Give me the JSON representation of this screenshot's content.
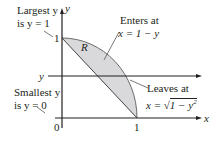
{
  "diagram": {
    "region_label": "R",
    "axes": {
      "x_label": "x",
      "y_label": "y"
    },
    "ticks": {
      "origin": "0",
      "x_one": "1",
      "y_one": "1"
    },
    "horizontal_line_label": "y",
    "annotations": {
      "largest": {
        "line1": "Largest y",
        "line2": "is y = 1"
      },
      "smallest": {
        "line1": "Smallest y",
        "line2": "is y = 0"
      },
      "enters": {
        "line1": "Enters at",
        "line2": "x = 1 − y"
      },
      "leaves": {
        "line1": "Leaves at",
        "line2_prefix": "x = ",
        "line2_radicand": "1 − y",
        "line2_exp": "2"
      }
    },
    "colors": {
      "fill": "#d9d9db",
      "stroke": "#231f20",
      "arc": "#5a5a5a"
    }
  }
}
